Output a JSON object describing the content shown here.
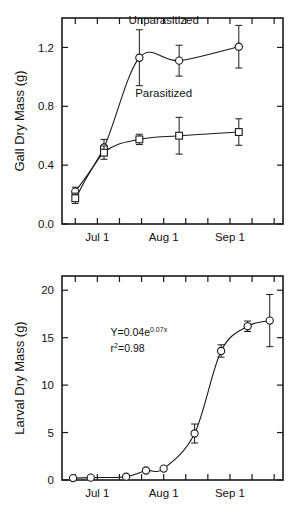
{
  "figure": {
    "name": "two-panel-growth-figure",
    "background": "#ffffff",
    "ink_color": "#1a1a1a"
  },
  "chart_data": [
    {
      "id": "gall-dry-mass",
      "type": "line",
      "title": "",
      "xlabel": "",
      "ylabel": "Gall Dry Mass (g)",
      "ylim": [
        0.0,
        1.4
      ],
      "yticks": [
        0.0,
        0.4,
        0.8,
        1.2
      ],
      "yticklabels": [
        "0.0",
        "0.4",
        "0.8",
        "1.2"
      ],
      "xlim": [
        0,
        100
      ],
      "xticks": [
        6,
        16,
        26,
        36,
        46,
        56,
        66,
        76,
        86,
        96
      ],
      "xtick_labeled": [
        {
          "x": 16,
          "label": "Jul 1"
        },
        {
          "x": 46,
          "label": "Aug 1"
        },
        {
          "x": 76,
          "label": "Sep 1"
        }
      ],
      "grid": false,
      "legend_position": "inline-annotation",
      "series": [
        {
          "name": "Unparasitized",
          "marker": "circle",
          "label_x": 46,
          "label_y": 1.36,
          "x": [
            6,
            19,
            35,
            53,
            80
          ],
          "values": [
            0.22,
            0.52,
            1.13,
            1.11,
            1.205
          ],
          "errors": [
            0.03,
            0.055,
            0.19,
            0.105,
            0.145
          ]
        },
        {
          "name": "Parasitized",
          "marker": "square",
          "label_x": 46,
          "label_y": 0.86,
          "x": [
            6,
            19,
            35,
            53,
            80
          ],
          "values": [
            0.175,
            0.485,
            0.575,
            0.6,
            0.625
          ],
          "errors": [
            0.035,
            0.045,
            0.035,
            0.125,
            0.09
          ]
        }
      ]
    },
    {
      "id": "larval-dry-mass",
      "type": "line",
      "title": "",
      "xlabel": "",
      "ylabel": "Larval Dry Mass (g)",
      "ylim": [
        0,
        21.5
      ],
      "yticks": [
        0,
        5,
        10,
        15,
        20
      ],
      "yticklabels": [
        "0",
        "5",
        "10",
        "15",
        "20"
      ],
      "xlim": [
        0,
        100
      ],
      "xticks": [
        6,
        16,
        26,
        36,
        46,
        56,
        66,
        76,
        86,
        96
      ],
      "xtick_labeled": [
        {
          "x": 16,
          "label": "Jul 1"
        },
        {
          "x": 46,
          "label": "Aug 1"
        },
        {
          "x": 76,
          "label": "Sep 1"
        }
      ],
      "grid": false,
      "annotation": {
        "equation_prefix": "Y=0.04e",
        "equation_exponent": "0.07x",
        "r_symbol": "r",
        "r_exponent": "2",
        "r_value": "=0.98",
        "x": 22,
        "y": 15.2
      },
      "series": [
        {
          "name": "Larval dry mass",
          "marker": "circle",
          "x": [
            5,
            13,
            29,
            38,
            46,
            60,
            72,
            84,
            94
          ],
          "values": [
            0.2,
            0.25,
            0.35,
            1.0,
            1.2,
            4.9,
            13.6,
            16.2,
            16.8
          ],
          "errors": [
            0,
            0,
            0,
            0,
            0,
            1.0,
            0.65,
            0.55,
            2.75
          ]
        }
      ]
    }
  ]
}
